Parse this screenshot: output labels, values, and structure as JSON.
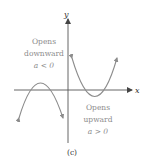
{
  "diagram": {
    "axes": {
      "x_label": "x",
      "y_label": "y",
      "color": "#555555"
    },
    "curves": [
      {
        "name": "downward-parabola",
        "label_lines": [
          "Opens",
          "downward",
          "a < 0"
        ],
        "color": "#8c8c8c"
      },
      {
        "name": "upward-parabola",
        "label_lines": [
          "Opens",
          "upward",
          "a > 0"
        ],
        "color": "#8c8c8c"
      }
    ],
    "caption": "(c)"
  }
}
